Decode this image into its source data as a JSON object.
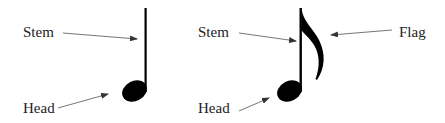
{
  "diagram": {
    "notes": [
      {
        "type": "quarter-note",
        "labels": {
          "stem": "Stem",
          "head": "Head"
        }
      },
      {
        "type": "eighth-note",
        "labels": {
          "stem": "Stem",
          "head": "Head",
          "flag": "Flag"
        }
      }
    ],
    "colors": {
      "note": "#000000",
      "text": "#222222",
      "arrow": "#555555"
    }
  }
}
